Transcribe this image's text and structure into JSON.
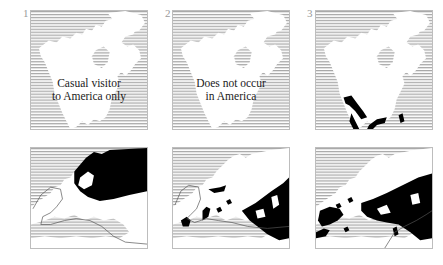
{
  "figure": {
    "panels": [
      {
        "number": "1",
        "america": {
          "caption_line1": "Casual visitor",
          "caption_line2": "to America only",
          "has_range": false
        },
        "europe": {
          "range_region": "north-east (Scandinavia, Russia)",
          "has_boundary_line": true
        }
      },
      {
        "number": "2",
        "america": {
          "caption_line1": "Does not occur",
          "caption_line2": "in America",
          "has_range": false
        },
        "europe": {
          "range_region": "south-east and scattered Mediterranean",
          "has_boundary_line": true
        }
      },
      {
        "number": "3",
        "america": {
          "caption_line1": "",
          "caption_line2": "",
          "has_range": true,
          "range_region": "south-west USA and Mexico"
        },
        "europe": {
          "range_region": "south and south-east Europe, Iberia, North Africa",
          "has_boundary_line": true
        }
      }
    ],
    "legend": {
      "sea_fill": "horizontal line hatching",
      "land_fill": "white",
      "range_fill": "black"
    },
    "colors": {
      "hatch": "#a8a8a8",
      "range": "#000000",
      "border": "#bdbdbd",
      "label": "#9a9a9a",
      "text": "#1a1a1a"
    }
  }
}
